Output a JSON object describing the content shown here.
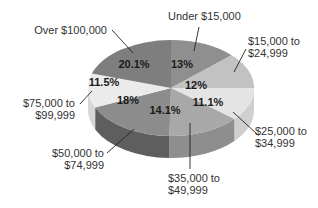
{
  "chart_data": {
    "type": "pie",
    "style": "3d",
    "title": "",
    "start_angle": "12 o'clock",
    "direction": "clockwise",
    "categories": [
      "Under $15,000",
      "$15,000 to $24,999",
      "$25,000 to $34,999",
      "$35,000 to $49,999",
      "$50,000 to $74,999",
      "$75,000 to $99,999",
      "Over $100,000"
    ],
    "values": [
      13,
      12,
      11.1,
      14.1,
      18,
      11.5,
      20.1
    ],
    "value_labels": [
      "13%",
      "12%",
      "11.1%",
      "14.1%",
      "18%",
      "11.5%",
      "20.1%"
    ],
    "label_lines": [
      [
        "Under $15,000"
      ],
      [
        "$15,000 to",
        "$24,999"
      ],
      [
        "$25,000 to",
        "$34,999"
      ],
      [
        "$35,000 to",
        "$49,999"
      ],
      [
        "$50,000 to",
        "$74,999"
      ],
      [
        "$75,000 to",
        "$99,999"
      ],
      [
        "Over $100,000"
      ]
    ],
    "colors": [
      "#8f8f8f",
      "#c2c2c2",
      "#e4e4e4",
      "#a8a8a8",
      "#8c8c8c",
      "#ebebeb",
      "#7e7e7e"
    ],
    "side_colors": [
      "#777777",
      "#a5a5a5",
      "#cfcfcf",
      "#8e8e8e",
      "#5e5e5e",
      "#d6d6d6",
      "#666666"
    ],
    "legend": "none (callout labels)",
    "grid": false
  }
}
